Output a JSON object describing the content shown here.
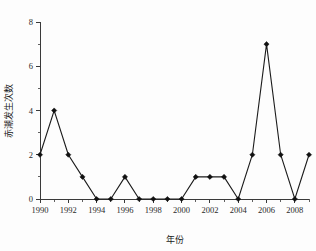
{
  "chart_data": {
    "type": "line",
    "title": "",
    "xlabel": "年份",
    "ylabel": "赤潮发生次数",
    "x": [
      1990,
      1991,
      1992,
      1993,
      1994,
      1995,
      1996,
      1997,
      1998,
      1999,
      2000,
      2001,
      2002,
      2003,
      2004,
      2005,
      2006,
      2007,
      2008,
      2009
    ],
    "values": [
      2,
      4,
      2,
      1,
      0,
      0,
      1,
      0,
      0,
      0,
      0,
      1,
      1,
      1,
      0,
      2,
      7,
      2,
      0,
      2
    ],
    "series": [
      {
        "name": "赤潮发生次数",
        "values": [
          2,
          4,
          2,
          1,
          0,
          0,
          1,
          0,
          0,
          0,
          0,
          1,
          1,
          1,
          0,
          2,
          7,
          2,
          0,
          2
        ]
      }
    ],
    "xlim": [
      1990,
      2009
    ],
    "ylim": [
      0,
      8
    ],
    "xticks": [
      1990,
      1992,
      1994,
      1996,
      1998,
      2000,
      2002,
      2004,
      2006,
      2008
    ],
    "xtick_labels": [
      "1990",
      "1992",
      "1994",
      "1996",
      "1998",
      "2000",
      "2002",
      "2004",
      "2006",
      "2008"
    ],
    "x_minor_ticks": [
      1991,
      1993,
      1995,
      1997,
      1999,
      2001,
      2003,
      2005,
      2007,
      2009
    ],
    "yticks": [
      0,
      2,
      4,
      6,
      8
    ],
    "ytick_labels": [
      "0",
      "2",
      "4",
      "6",
      "8"
    ],
    "y_minor_ticks": [
      1,
      3,
      5,
      7
    ],
    "grid": false,
    "legend": false,
    "legend_position": "none",
    "marker": "diamond",
    "line_color": "#111111",
    "marker_color": "#111111",
    "axis_color": "#3a3a3a"
  }
}
